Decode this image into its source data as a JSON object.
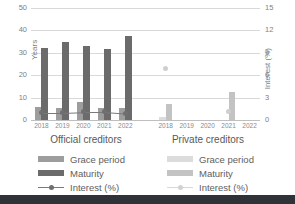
{
  "chart_data": {
    "type": "bar",
    "title": "",
    "xlabel": "",
    "ylabel": "Years",
    "y2label": "Interest (%)",
    "ylim": [
      0,
      50
    ],
    "y2lim": [
      0,
      15
    ],
    "yticks": [
      "0",
      "10",
      "20",
      "30",
      "40",
      "50"
    ],
    "y2ticks": [
      "0",
      "3",
      "6",
      "9",
      "12",
      "15"
    ],
    "grid": true,
    "legend_position": "bottom",
    "categories": [
      "2018",
      "2019",
      "2020",
      "2021",
      "2022"
    ],
    "panels": [
      {
        "name": "Official creditors",
        "label": "Official creditors",
        "series": [
          {
            "name": "Grace period",
            "axis": "left",
            "values": [
              6.0,
              5.5,
              8.0,
              5.5,
              5.5
            ]
          },
          {
            "name": "Maturity",
            "axis": "left",
            "values": [
              32.3,
              35.0,
              33.2,
              31.8,
              37.3
            ]
          },
          {
            "name": "Interest (%)",
            "axis": "right",
            "values": [
              1.0,
              1.0,
              1.1,
              1.1,
              0.9
            ]
          }
        ]
      },
      {
        "name": "Private creditors",
        "label": "Private creditors",
        "series": [
          {
            "name": "Grace period",
            "axis": "left",
            "values": [
              1.5,
              0,
              0,
              0,
              0
            ]
          },
          {
            "name": "Maturity",
            "axis": "left",
            "values": [
              7.0,
              0,
              0,
              12.5,
              0
            ]
          },
          {
            "name": "Interest (%)",
            "axis": "right",
            "values": [
              6.9,
              null,
              null,
              1.1,
              null
            ]
          }
        ]
      }
    ]
  },
  "legends": [
    {
      "panel": "Official creditors",
      "entries": [
        {
          "label": "Grace period",
          "marker": "swatch-grace-official",
          "color": "#9d9d9d"
        },
        {
          "label": "Maturity",
          "marker": "swatch-maturity-official",
          "color": "#6b6b6b"
        },
        {
          "label": "Interest (%)",
          "marker": "line-marker-official",
          "color": "#6f6f6f"
        }
      ]
    },
    {
      "panel": "Private creditors",
      "entries": [
        {
          "label": "Grace period",
          "marker": "swatch-grace-private",
          "color": "#dcdcdc"
        },
        {
          "label": "Maturity",
          "marker": "swatch-maturity-private",
          "color": "#c3c3c3"
        },
        {
          "label": "Interest (%)",
          "marker": "line-marker-private",
          "color": "#d2d2d2"
        }
      ]
    }
  ],
  "colors": {
    "grace_official": "#9d9d9d",
    "maturity_official": "#6b6b6b",
    "grace_private": "#dcdcdc",
    "maturity_private": "#c3c3c3",
    "interest_official": "#6f6f6f",
    "interest_private": "#d2d2d2",
    "gridline": "#d9d9d9",
    "text": "#595959",
    "bottom_bar": "#2f3237"
  }
}
